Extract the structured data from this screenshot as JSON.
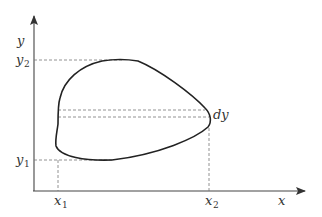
{
  "diagram": {
    "axes": {
      "x_label": "x",
      "y_label": "y"
    },
    "ticks": {
      "x1": {
        "base": "x",
        "sub": "1"
      },
      "x2": {
        "base": "x",
        "sub": "2"
      },
      "y1": {
        "base": "y",
        "sub": "1"
      },
      "y2": {
        "base": "y",
        "sub": "2"
      }
    },
    "annotation": "dy",
    "colors": {
      "curve": "#222222",
      "axis": "#444444",
      "dashed": "#777777"
    }
  }
}
